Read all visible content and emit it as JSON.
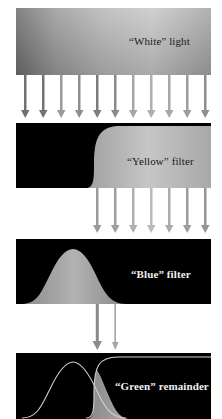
{
  "diagram": {
    "panels": [
      {
        "id": "white",
        "label": "“White” light",
        "background": "#a8a8a8",
        "text_color": "#1a1a1a"
      },
      {
        "id": "yellow",
        "label": "“Yellow” filter",
        "background": "#000000",
        "pass_color": "#b4b4b4",
        "text_color": "#1a1a1a"
      },
      {
        "id": "blue",
        "label": "“Blue” filter",
        "background": "#000000",
        "pass_color": "#a0a0a0",
        "text_color": "#f0f0f0"
      },
      {
        "id": "green",
        "label": "“Green” remainder",
        "background": "#000000",
        "overlap_color": "#9a9a9a",
        "curve_color": "#cfcfcf",
        "text_color": "#f0f0f0"
      }
    ],
    "arrow_groups": [
      {
        "from": "white",
        "to": "yellow",
        "count": 11
      },
      {
        "from": "yellow",
        "to": "blue",
        "count": 7
      },
      {
        "from": "blue",
        "to": "green",
        "count": 2
      }
    ]
  }
}
